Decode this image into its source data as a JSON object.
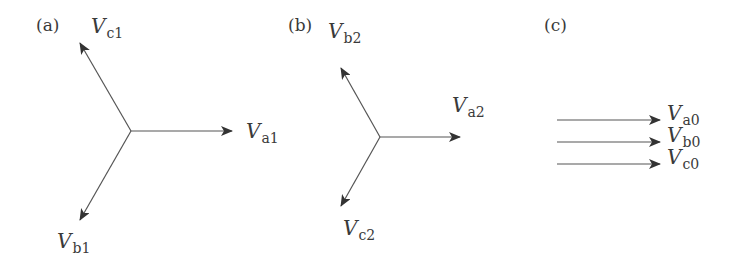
{
  "figure": {
    "panels": [
      {
        "id": "a",
        "label": "(a)",
        "title": "Positive-sequence components",
        "vectors": [
          {
            "name": "Va1",
            "symbol": "V",
            "subscript": "a1",
            "angle_deg": 0
          },
          {
            "name": "Vb1",
            "symbol": "V",
            "subscript": "b1",
            "angle_deg": -120
          },
          {
            "name": "Vc1",
            "symbol": "V",
            "subscript": "c1",
            "angle_deg": 120
          }
        ]
      },
      {
        "id": "b",
        "label": "(b)",
        "title": "Negative-sequence components",
        "vectors": [
          {
            "name": "Va2",
            "symbol": "V",
            "subscript": "a2",
            "angle_deg": 0
          },
          {
            "name": "Vb2",
            "symbol": "V",
            "subscript": "b2",
            "angle_deg": 120
          },
          {
            "name": "Vc2",
            "symbol": "V",
            "subscript": "c2",
            "angle_deg": -120
          }
        ]
      },
      {
        "id": "c",
        "label": "(c)",
        "title": "Zero-sequence components",
        "vectors": [
          {
            "name": "Va0",
            "symbol": "V",
            "subscript": "a0",
            "angle_deg": 0
          },
          {
            "name": "Vb0",
            "symbol": "V",
            "subscript": "b0",
            "angle_deg": 0
          },
          {
            "name": "Vc0",
            "symbol": "V",
            "subscript": "c0",
            "angle_deg": 0
          }
        ]
      }
    ],
    "colors": {
      "line": "#555555",
      "arrowhead": "#333333",
      "text": "#3a3a3a"
    }
  }
}
